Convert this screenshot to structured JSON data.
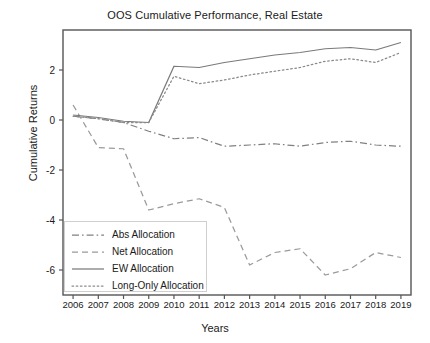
{
  "chart_data": {
    "type": "line",
    "title": "OOS Cumulative Performance, Real Estate",
    "xlabel": "Years",
    "ylabel": "Cumulative Returns",
    "grid": false,
    "legend_position": "lower left",
    "x": [
      2006,
      2007,
      2008,
      2009,
      2010,
      2011,
      2012,
      2013,
      2014,
      2015,
      2016,
      2017,
      2018,
      2019
    ],
    "xtick_labels": [
      "2006",
      "2007",
      "2008",
      "2009",
      "2010",
      "2011",
      "2012",
      "2013",
      "2014",
      "2015",
      "2016",
      "2017",
      "2018",
      "2019"
    ],
    "ytick_labels": [
      "2",
      "0",
      "-2",
      "-4",
      "-6"
    ],
    "ytick_values": [
      2,
      0,
      -2,
      -4,
      -6
    ],
    "xlim": [
      2005.6,
      2019.4
    ],
    "ylim": [
      -7.0,
      3.6
    ],
    "series": [
      {
        "name": "Abs Allocation",
        "style": "dashdot",
        "color": "#808080",
        "values": [
          0.15,
          0.05,
          -0.1,
          -0.45,
          -0.75,
          -0.7,
          -1.05,
          -1.0,
          -0.95,
          -1.05,
          -0.9,
          -0.85,
          -1.0,
          -1.05
        ]
      },
      {
        "name": "Net Allocation",
        "style": "dashed",
        "color": "#9a9a9a",
        "values": [
          0.6,
          -1.1,
          -1.15,
          -3.6,
          -3.35,
          -3.15,
          -3.5,
          -5.8,
          -5.3,
          -5.15,
          -6.2,
          -5.95,
          -5.3,
          -5.5
        ]
      },
      {
        "name": "EW Allocation",
        "style": "solid",
        "color": "#7a7a7a",
        "values": [
          0.2,
          0.1,
          -0.05,
          -0.1,
          2.15,
          2.1,
          2.3,
          2.45,
          2.6,
          2.7,
          2.85,
          2.9,
          2.8,
          3.1
        ]
      },
      {
        "name": "Long-Only Allocation",
        "style": "dotted",
        "color": "#8a8a8a",
        "values": [
          0.15,
          0.05,
          -0.1,
          -0.1,
          1.75,
          1.45,
          1.6,
          1.8,
          1.95,
          2.1,
          2.35,
          2.45,
          2.3,
          2.7
        ]
      }
    ]
  },
  "legend": {
    "items": [
      {
        "label": "Abs Allocation"
      },
      {
        "label": "Net Allocation"
      },
      {
        "label": "EW Allocation"
      },
      {
        "label": "Long-Only Allocation"
      }
    ]
  },
  "colors": {
    "axis": "#555555",
    "text": "#1a1a1a",
    "background": "#ffffff"
  }
}
